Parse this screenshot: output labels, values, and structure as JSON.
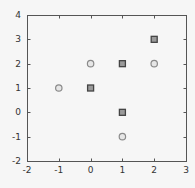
{
  "chart_data": {
    "type": "scatter",
    "title": "",
    "xlabel": "",
    "ylabel": "",
    "xlim": [
      -2,
      3
    ],
    "ylim": [
      -2,
      4
    ],
    "xticks": [
      -2,
      -1,
      0,
      1,
      2,
      3
    ],
    "yticks": [
      -2,
      -1,
      0,
      1,
      2,
      3,
      4
    ],
    "grid": false,
    "legend": null,
    "series": [
      {
        "name": "squares",
        "marker": "square",
        "edge_color": "#444444",
        "fill_color": "#9a9a9a",
        "points": [
          [
            0,
            1
          ],
          [
            1,
            2
          ],
          [
            1,
            0
          ],
          [
            2,
            3
          ]
        ]
      },
      {
        "name": "circles",
        "marker": "circle",
        "edge_color": "#8a8a8a",
        "fill_color": "#e6e6e6",
        "points": [
          [
            -1,
            1
          ],
          [
            0,
            2
          ],
          [
            1,
            -1
          ],
          [
            2,
            2
          ]
        ]
      }
    ]
  },
  "layout": {
    "plot_left": 27,
    "plot_right": 186,
    "plot_top": 15,
    "plot_bottom": 161,
    "axis_color": "#555555",
    "background": "#f6f6f6"
  }
}
